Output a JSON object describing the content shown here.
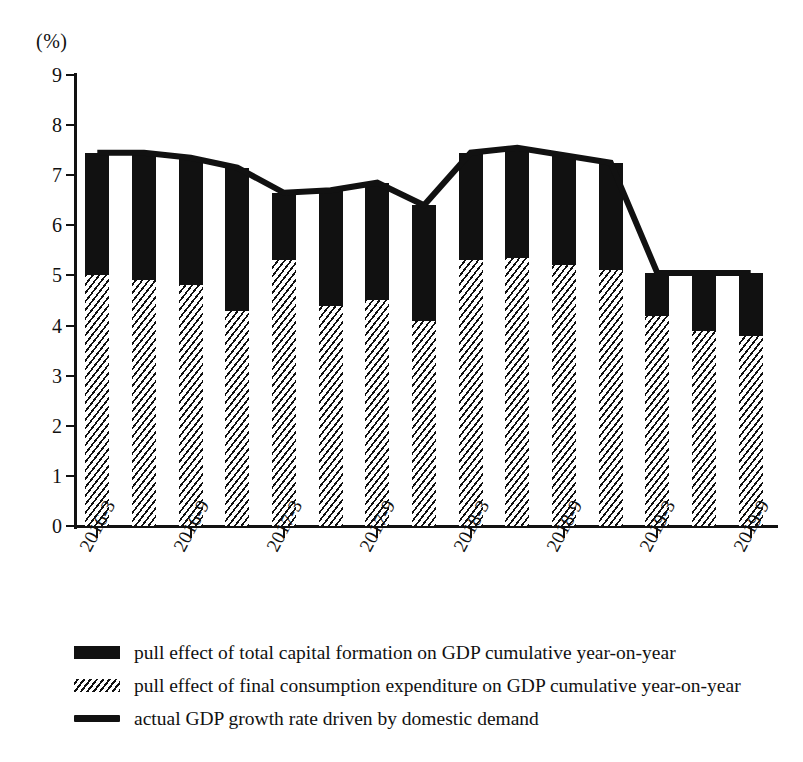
{
  "chart_data": {
    "type": "bar",
    "title": "",
    "subtitle": "",
    "unit_label": "(%)",
    "xlabel": "",
    "ylabel": "",
    "ylim": [
      0,
      9
    ],
    "ytick_values": [
      0,
      1,
      2,
      3,
      4,
      5,
      6,
      7,
      8,
      9
    ],
    "ytick_labels": [
      "0",
      "1",
      "2",
      "3",
      "4",
      "5",
      "6",
      "7",
      "8",
      "9"
    ],
    "grid": false,
    "legend_position": "bottom-left",
    "stacked": true,
    "x": [
      "2016-3",
      "2016-6",
      "2016-9",
      "2016-12",
      "2017-3",
      "2017-6",
      "2017-9",
      "2017-12",
      "2018-3",
      "2018-6",
      "2018-9",
      "2018-12",
      "2019-3",
      "2019-6",
      "2019-9"
    ],
    "xtick_labels": [
      "2016-3",
      "2016-9",
      "2017-3",
      "2017-9",
      "2018-3",
      "2018-9",
      "2019-3",
      "2019-9"
    ],
    "xtick_indices": [
      0,
      2,
      4,
      6,
      8,
      10,
      12,
      14
    ],
    "series": [
      {
        "name": "pull effect of final consumption expenditure on GDP cumulative year-on-year",
        "type": "bar",
        "pattern": "hatched",
        "color": "#111111",
        "values": [
          5.0,
          4.9,
          4.8,
          4.3,
          5.3,
          4.4,
          4.5,
          4.1,
          5.3,
          5.35,
          5.2,
          5.1,
          4.2,
          3.9,
          3.8
        ]
      },
      {
        "name": "pull effect of total capital formation on GDP cumulative year-on-year",
        "type": "bar",
        "pattern": "solid",
        "color": "#111111",
        "values": [
          2.45,
          2.55,
          2.55,
          2.85,
          1.35,
          2.3,
          2.35,
          2.3,
          2.15,
          2.2,
          2.2,
          2.15,
          0.85,
          1.15,
          1.25
        ]
      },
      {
        "name": "actual GDP growth rate driven by domestic demand",
        "type": "line",
        "color": "#111111",
        "values": [
          7.45,
          7.45,
          7.35,
          7.15,
          6.65,
          6.7,
          6.85,
          6.4,
          7.45,
          7.55,
          7.4,
          7.25,
          5.05,
          5.05,
          5.05
        ]
      }
    ]
  },
  "legend": {
    "items": [
      {
        "marker": "solid-swatch",
        "label": "pull effect of total capital formation on GDP cumulative year-on-year"
      },
      {
        "marker": "hatched-swatch",
        "label": "pull effect of final consumption expenditure on GDP cumulative year-on-year"
      },
      {
        "marker": "line-swatch",
        "label": "actual GDP growth rate driven by domestic demand"
      }
    ]
  }
}
